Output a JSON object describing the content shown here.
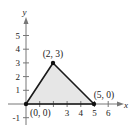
{
  "diagram": {
    "type": "coordinate-plane-triangle",
    "axes": {
      "x_label": "x",
      "y_label": "y",
      "x_ticks": [
        "3",
        "4",
        "5",
        "6"
      ],
      "y_ticks": [
        "1",
        "2",
        "3",
        "4",
        "5",
        "-1"
      ]
    },
    "vertices": [
      {
        "label": "(0, 0)",
        "x": 0,
        "y": 0
      },
      {
        "label": "(2, 3)",
        "x": 2,
        "y": 3
      },
      {
        "label": "(5, 0)",
        "x": 5,
        "y": 0
      }
    ],
    "colors": {
      "fill": "#e6e6e6",
      "stroke": "#1a1a1a",
      "axis": "#777777"
    }
  }
}
